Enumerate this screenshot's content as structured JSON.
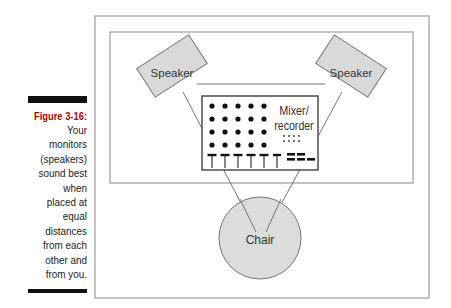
{
  "caption": {
    "title": "Figure 3-16:",
    "text": "Your\nmonitors\n(speakers)\nsound best\nwhen\nplaced at\nequal\ndistances\nfrom each\nother and\nfrom you."
  },
  "diagram": {
    "left_speaker_label": "Speaker",
    "right_speaker_label": "Speaker",
    "mixer_label_line1": "Mixer/",
    "mixer_label_line2": "recorder",
    "chair_label": "Chair",
    "colors": {
      "shape_fill": "#d9d9d9",
      "line": "#666666",
      "caption_title": "#b20000"
    }
  }
}
